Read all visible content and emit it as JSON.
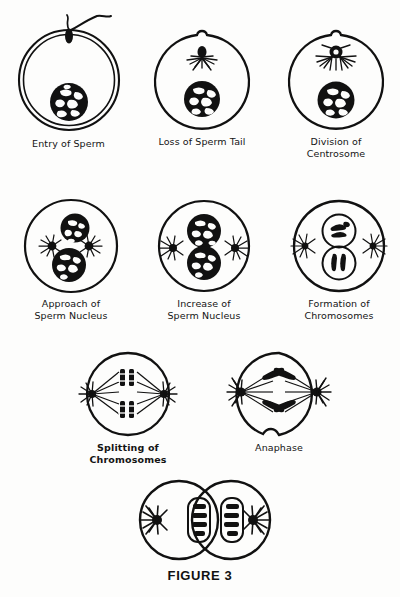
{
  "figure": {
    "caption": "FIGURE 3",
    "ink_color": "#111111",
    "background_color": "#fdfdfc"
  },
  "stages": [
    {
      "id": "entry-of-sperm",
      "label": "Entry of Sperm",
      "bold": false,
      "features": "double-walled egg membrane, sperm head at top with two tails, egg nucleus below"
    },
    {
      "id": "loss-of-sperm-tail",
      "label": "Loss of Sperm Tail",
      "bold": false,
      "features": "entry cone bump at top, sperm head with single aster, egg nucleus below"
    },
    {
      "id": "division-of-centrosome",
      "label": "Division of\nCentrosome",
      "bold": false,
      "features": "sperm nucleus with doubled centrosome and spreading aster rays, egg nucleus below"
    },
    {
      "id": "approach-of-sperm-nucleus",
      "label": "Approach of\nSperm Nucleus",
      "bold": false,
      "features": "two nuclei approaching with two asters between them"
    },
    {
      "id": "increase-of-sperm-nucleus",
      "label": "Increase of\nSperm Nucleus",
      "bold": false,
      "features": "two equal touching nuclei, asters moved to opposite poles"
    },
    {
      "id": "formation-of-chromosomes",
      "label": "Formation of\nChromosomes",
      "bold": false,
      "features": "paired nuclei containing distinct chromosomes, asters at poles"
    },
    {
      "id": "splitting-of-chromosomes",
      "label": "Splitting of\nChromosomes",
      "bold": true,
      "features": "spindle between two asters with chromosome pairs at equatorial plate"
    },
    {
      "id": "anaphase",
      "label": "Anaphase",
      "bold": false,
      "features": "V-shaped chromosomes migrating to opposite poles, cleavage furrow starting"
    },
    {
      "id": "daughter-cells",
      "label": "",
      "bold": false,
      "features": "two daughter cells, each with an aster and a nucleus holding chromosome bands"
    }
  ]
}
